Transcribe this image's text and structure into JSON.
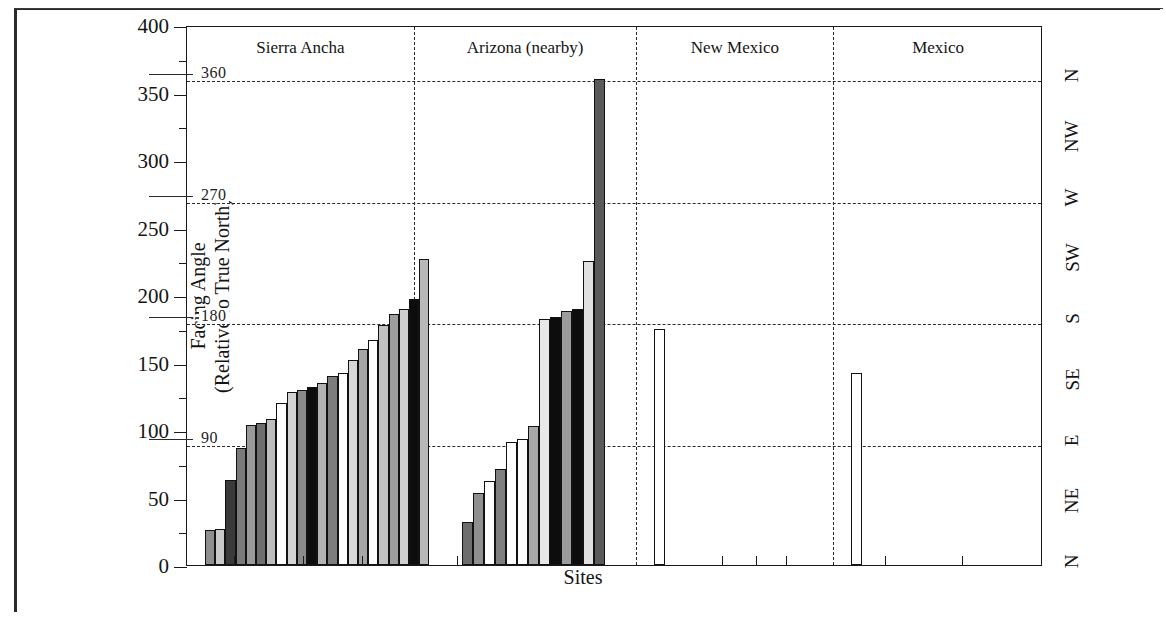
{
  "axes": {
    "y_title_line1": "Facing Angle",
    "y_title_line2": "(Relative to True North)",
    "x_title": "Sites",
    "y_ticks": [
      0,
      50,
      100,
      150,
      200,
      250,
      300,
      350,
      400
    ],
    "y_minor_ticks": [
      25,
      75,
      125,
      175,
      225,
      275,
      325,
      375
    ],
    "y_min": 0,
    "y_max": 400
  },
  "gridlines": [
    {
      "value": 90,
      "label": "90"
    },
    {
      "value": 180,
      "label": "180"
    },
    {
      "value": 270,
      "label": "270"
    },
    {
      "value": 360,
      "label": "360"
    }
  ],
  "compass_labels": [
    {
      "label": "N",
      "value": 360
    },
    {
      "label": "NW",
      "value": 315
    },
    {
      "label": "W",
      "value": 270
    },
    {
      "label": "SW",
      "value": 225
    },
    {
      "label": "S",
      "value": 180
    },
    {
      "label": "SE",
      "value": 135
    },
    {
      "label": "E",
      "value": 90
    },
    {
      "label": "NE",
      "value": 45
    },
    {
      "label": "N",
      "value": 0
    }
  ],
  "chart_data": {
    "type": "bar",
    "title": "",
    "xlabel": "Sites",
    "ylabel": "Facing Angle (Relative to True North)",
    "ylim": [
      0,
      400
    ],
    "grid": true,
    "legend": "none",
    "groups": [
      {
        "name": "Sierra Ancha",
        "values": [
          26,
          27,
          63,
          87,
          104,
          105,
          108,
          120,
          128,
          130,
          132,
          135,
          140,
          142,
          152,
          160,
          167,
          178,
          186,
          190,
          197,
          227
        ],
        "fills": [
          "#8e8e8e",
          "#c9c9c9",
          "#3a3a3a",
          "#7a7a7a",
          "#9a9a9a",
          "#6f6f6f",
          "#bdbdbd",
          "#ffffff",
          "#d4d4d4",
          "#8a8a8a",
          "#0d0d0d",
          "#b3b3b3",
          "#7d7d7d",
          "#ffffff",
          "#d8d8d8",
          "#a6a6a6",
          "#ffffff",
          "#c2c2c2",
          "#9e9e9e",
          "#cfcfcf",
          "#0d0d0d",
          "#b8b8b8"
        ]
      },
      {
        "name": "Arizona (nearby)",
        "values": [
          32,
          53,
          62,
          71,
          91,
          93,
          103,
          182,
          184,
          188,
          190,
          225,
          360
        ],
        "fills": [
          "#6d6d6d",
          "#8f8f8f",
          "#ffffff",
          "#7f7f7f",
          "#ffffff",
          "#ffffff",
          "#a8a8a8",
          "#e8e8e8",
          "#0d0d0d",
          "#9c9c9c",
          "#0d0d0d",
          "#e0e0e0",
          "#5a5a5a"
        ]
      },
      {
        "name": "New Mexico",
        "values": [
          175
        ],
        "fills": [
          "#ffffff"
        ]
      },
      {
        "name": "Mexico",
        "values": [
          142
        ],
        "fills": [
          "#ffffff"
        ]
      }
    ]
  }
}
